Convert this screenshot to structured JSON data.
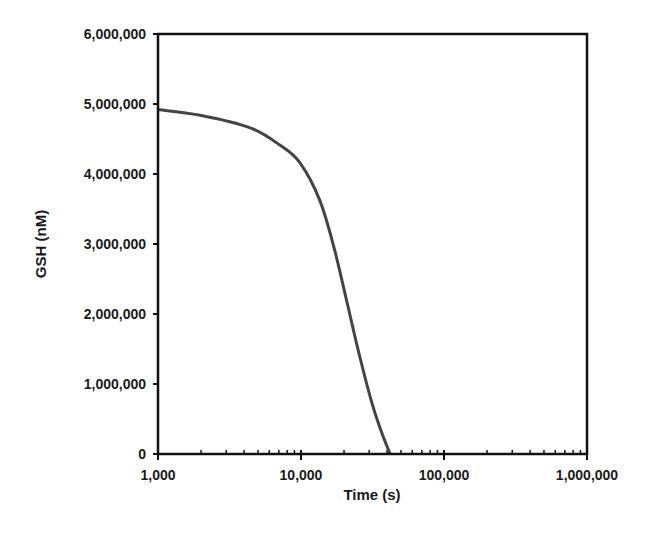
{
  "chart_data": {
    "type": "line",
    "title": "",
    "xlabel": "Time (s)",
    "ylabel": "GSH (nM)",
    "xscale": "log",
    "xlim": [
      1000,
      1000000
    ],
    "ylim": [
      0,
      6000000
    ],
    "x_ticks": [
      1000,
      10000,
      100000,
      1000000
    ],
    "x_tick_labels": [
      "1,000",
      "10,000",
      "100,000",
      "1,000,000"
    ],
    "y_ticks": [
      0,
      1000000,
      2000000,
      3000000,
      4000000,
      5000000,
      6000000
    ],
    "y_tick_labels": [
      "0",
      "1,000,000",
      "2,000,000",
      "3,000,000",
      "4,000,000",
      "5,000,000",
      "6,000,000"
    ],
    "grid": false,
    "legend": null,
    "series": [
      {
        "name": "GSH",
        "color": "#444444",
        "x": [
          1000,
          1970,
          4410,
          7150,
          9840,
          13500,
          17000,
          20800,
          25000,
          30900,
          36000,
          42000
        ],
        "y": [
          4920000,
          4840000,
          4660000,
          4410000,
          4160000,
          3630000,
          2950000,
          2200000,
          1500000,
          770000,
          350000,
          0
        ]
      }
    ]
  }
}
